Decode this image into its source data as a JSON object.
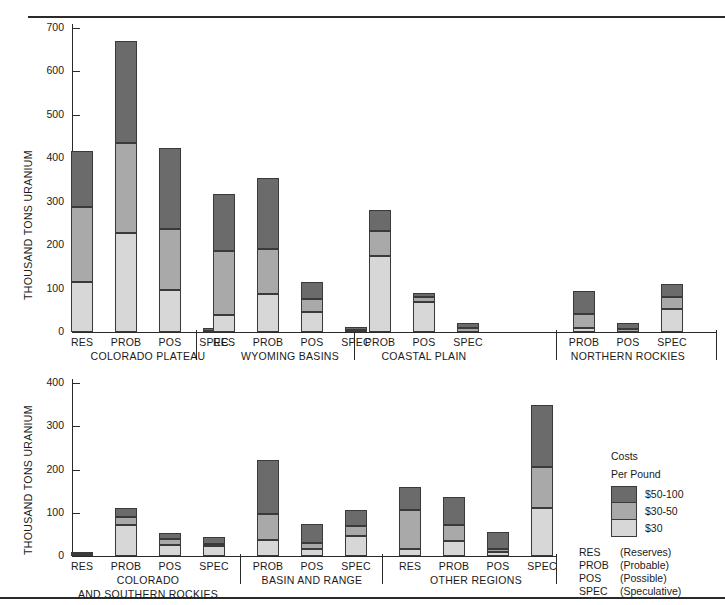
{
  "chart_data": [
    {
      "type": "bar",
      "id": "top-panel",
      "title": "",
      "ylabel": "THOUSAND TONS URANIUM",
      "xlabel": "",
      "ylim": [
        0,
        700
      ],
      "yticks": [
        0,
        100,
        200,
        300,
        400,
        500,
        600,
        700
      ],
      "ytick_labels": [
        "0",
        "100",
        "200",
        "300",
        "400",
        "500",
        "600",
        "700"
      ],
      "grid": false,
      "stacked": true,
      "legend_position": "outside-right-lower-panel",
      "series": [
        {
          "name": "$30",
          "color": "#d7d7d7"
        },
        {
          "name": "$30-50",
          "color": "#a9a9a9"
        },
        {
          "name": "$50-100",
          "color": "#6b6b6b"
        }
      ],
      "groups": [
        {
          "label": "COLORADO PLATEAU",
          "categories": [
            "RES",
            "PROB",
            "POS",
            "SPEC"
          ],
          "values": {
            "$30": [
              116,
              229,
              97,
              0
            ],
            "$30-50": [
              171,
              206,
              141,
              3
            ],
            "$50-100": [
              129,
              235,
              186,
              6
            ]
          },
          "totals": [
            416,
            670,
            424,
            9
          ]
        },
        {
          "label": "WYOMING BASINS",
          "categories": [
            "RES",
            "PROB",
            "POS",
            "SPEC"
          ],
          "values": {
            "$30": [
              40,
              87,
              45,
              0
            ],
            "$30-50": [
              146,
              105,
              31,
              4
            ],
            "$50-100": [
              131,
              162,
              38,
              8
            ]
          },
          "totals": [
            317,
            354,
            114,
            12
          ]
        },
        {
          "label": "COASTAL PLAIN",
          "categories": [
            "PROB",
            "POS",
            "SPEC"
          ],
          "values": {
            "$30": [
              176,
              69,
              0
            ],
            "$30-50": [
              57,
              12,
              9
            ],
            "$50-100": [
              49,
              8,
              12
            ]
          },
          "totals": [
            282,
            89,
            21
          ]
        },
        {
          "label": "NORTHERN ROCKIES",
          "categories": [
            "PROB",
            "POS",
            "SPEC"
          ],
          "values": {
            "$30": [
              9,
              0,
              52
            ],
            "$30-50": [
              32,
              6,
              28
            ],
            "$50-100": [
              54,
              14,
              31
            ]
          },
          "totals": [
            95,
            20,
            111
          ]
        }
      ]
    },
    {
      "type": "bar",
      "id": "bottom-panel",
      "title": "",
      "ylabel": "THOUSAND TONS URANIUM",
      "xlabel": "",
      "ylim": [
        0,
        400
      ],
      "yticks": [
        0,
        100,
        200,
        300,
        400
      ],
      "ytick_labels": [
        "0",
        "100",
        "200",
        "300",
        "400"
      ],
      "grid": false,
      "stacked": true,
      "series": [
        {
          "name": "$30",
          "color": "#d7d7d7"
        },
        {
          "name": "$30-50",
          "color": "#a9a9a9"
        },
        {
          "name": "$50-100",
          "color": "#6b6b6b"
        }
      ],
      "groups": [
        {
          "label": "COLORADO",
          "label2": "AND SOUTHERN ROCKIES",
          "categories": [
            "RES",
            "PROB",
            "POS",
            "SPEC"
          ],
          "values": {
            "$30": [
              4,
              71,
              26,
              22
            ],
            "$30-50": [
              1,
              20,
              14,
              6
            ],
            "$50-100": [
              1,
              19,
              13,
              15
            ]
          },
          "totals": [
            6,
            110,
            53,
            43
          ]
        },
        {
          "label": "BASIN AND RANGE",
          "label2": "",
          "categories": [
            "PROB",
            "POS",
            "SPEC"
          ],
          "values": {
            "$30": [
              36,
              16,
              46
            ],
            "$30-50": [
              61,
              14,
              23
            ],
            "$50-100": [
              126,
              44,
              37
            ]
          },
          "totals": [
            223,
            74,
            106
          ]
        },
        {
          "label": "OTHER REGIONS",
          "label2": "",
          "categories": [
            "RES",
            "PROB",
            "POS",
            "SPEC"
          ],
          "values": {
            "$30": [
              16,
              35,
              9,
              110
            ],
            "$30-50": [
              91,
              36,
              8,
              96
            ],
            "$50-100": [
              53,
              65,
              38,
              143
            ]
          },
          "totals": [
            160,
            136,
            55,
            349
          ]
        }
      ]
    }
  ],
  "legend": {
    "title_line1": "Costs",
    "title_line2": "Per Pound",
    "items": [
      {
        "label": "$50-100",
        "color": "#6b6b6b"
      },
      {
        "label": "$30-50",
        "color": "#a9a9a9"
      },
      {
        "label": "$30",
        "color": "#d7d7d7"
      }
    ]
  },
  "abbreviations": [
    {
      "code": "RES",
      "text": "(Reserves)"
    },
    {
      "code": "PROB",
      "text": "(Probable)"
    },
    {
      "code": "POS",
      "text": "(Possible)"
    },
    {
      "code": "SPEC",
      "text": "(Speculative)"
    }
  ]
}
